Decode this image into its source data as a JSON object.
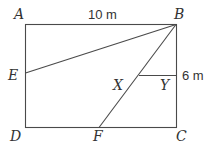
{
  "diagram": {
    "type": "geometry",
    "shape": "rectangle",
    "vertices": {
      "A": "A",
      "B": "B",
      "C": "C",
      "D": "D"
    },
    "points": {
      "E": "E",
      "F": "F",
      "X": "X",
      "Y": "Y"
    },
    "measurements": {
      "AB": "10 m",
      "BY": "6 m"
    },
    "segments": [
      "AB",
      "BC",
      "CD",
      "DA",
      "BE",
      "BF",
      "XY"
    ],
    "stroke_color": "#4a4a4a"
  }
}
